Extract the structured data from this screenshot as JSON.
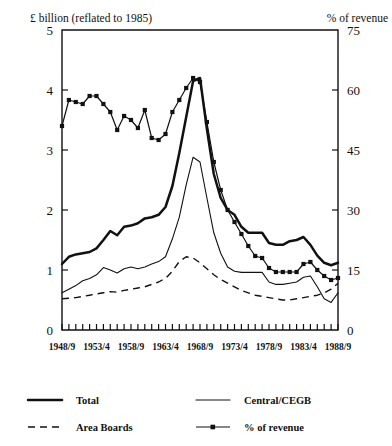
{
  "header": {
    "left_label": "£ billion (reflated to 1985)",
    "right_label": "% of revenue"
  },
  "legend": {
    "items": [
      {
        "label": "Total",
        "style": "thick-solid",
        "name": "legend-total"
      },
      {
        "label": "Central/CEGB",
        "style": "thin-solid",
        "name": "legend-central-cegb"
      },
      {
        "label": "Area Boards",
        "style": "dashed",
        "name": "legend-area-boards"
      },
      {
        "label": "% of revenue",
        "style": "marker-line",
        "name": "legend-pct-of-revenue"
      }
    ]
  },
  "chart_data": {
    "type": "line",
    "title": "",
    "xlabel": "",
    "ylabel": "£ billion (reflated to 1985)",
    "y2label": "% of revenue",
    "grid": false,
    "legend_position": "bottom",
    "ylim": [
      0,
      5
    ],
    "y2lim": [
      0,
      75
    ],
    "yticks": [
      0,
      1,
      2,
      3,
      4,
      5
    ],
    "y2ticks": [
      0,
      15,
      30,
      45,
      60,
      75
    ],
    "xticklabels": [
      "1948/9",
      "1953/4",
      "1958/9",
      "1963/4",
      "1968/9",
      "1973/4",
      "1978/9",
      "1983/4",
      "1988/9"
    ],
    "x": [
      "1948/9",
      "1949/50",
      "1950/1",
      "1951/2",
      "1952/3",
      "1953/4",
      "1954/5",
      "1955/6",
      "1956/7",
      "1957/8",
      "1958/9",
      "1959/60",
      "1960/1",
      "1961/2",
      "1962/3",
      "1963/4",
      "1964/5",
      "1965/6",
      "1966/7",
      "1967/8",
      "1968/9",
      "1969/70",
      "1970/1",
      "1971/2",
      "1972/3",
      "1973/4",
      "1974/5",
      "1975/6",
      "1976/7",
      "1977/8",
      "1978/9",
      "1979/80",
      "1980/1",
      "1981/2",
      "1982/3",
      "1983/4",
      "1984/5",
      "1985/6",
      "1986/7",
      "1987/8",
      "1988/9"
    ],
    "series": [
      {
        "name": "Total",
        "axis": "left",
        "style": "thick-solid",
        "values": [
          1.1,
          1.22,
          1.26,
          1.28,
          1.3,
          1.36,
          1.5,
          1.65,
          1.58,
          1.72,
          1.74,
          1.78,
          1.86,
          1.88,
          1.92,
          2.05,
          2.4,
          2.95,
          3.55,
          4.15,
          4.2,
          3.35,
          2.6,
          2.2,
          2.0,
          1.92,
          1.72,
          1.62,
          1.62,
          1.62,
          1.45,
          1.42,
          1.42,
          1.48,
          1.5,
          1.55,
          1.42,
          1.24,
          1.12,
          1.08,
          1.12
        ]
      },
      {
        "name": "Central/CEGB",
        "axis": "left",
        "style": "thin-solid",
        "values": [
          0.62,
          0.68,
          0.74,
          0.82,
          0.86,
          0.92,
          1.04,
          1.0,
          0.95,
          1.02,
          1.05,
          1.02,
          1.05,
          1.1,
          1.14,
          1.22,
          1.52,
          1.88,
          2.42,
          2.88,
          2.8,
          2.2,
          1.62,
          1.28,
          1.05,
          0.98,
          0.96,
          0.96,
          0.96,
          0.96,
          0.8,
          0.76,
          0.76,
          0.78,
          0.8,
          0.88,
          0.9,
          0.72,
          0.52,
          0.46,
          0.62
        ]
      },
      {
        "name": "Area Boards",
        "axis": "left",
        "style": "dashed",
        "values": [
          0.52,
          0.53,
          0.54,
          0.56,
          0.58,
          0.6,
          0.62,
          0.64,
          0.63,
          0.66,
          0.68,
          0.7,
          0.72,
          0.76,
          0.8,
          0.86,
          0.98,
          1.14,
          1.22,
          1.2,
          1.12,
          1.02,
          0.92,
          0.84,
          0.78,
          0.72,
          0.66,
          0.62,
          0.58,
          0.56,
          0.54,
          0.52,
          0.5,
          0.5,
          0.52,
          0.54,
          0.56,
          0.58,
          0.62,
          0.68,
          0.78
        ]
      },
      {
        "name": "% of revenue",
        "axis": "right",
        "style": "marker-line",
        "values": [
          51.0,
          57.5,
          57.0,
          56.5,
          58.5,
          58.5,
          56.5,
          54.5,
          50.0,
          53.5,
          52.5,
          50.5,
          55.0,
          48.0,
          47.5,
          49.0,
          54.5,
          57.5,
          60.5,
          63.0,
          62.0,
          52.0,
          42.0,
          35.0,
          30.0,
          27.0,
          24.0,
          21.0,
          18.5,
          18.0,
          15.5,
          14.5,
          14.5,
          14.5,
          14.5,
          16.5,
          17.0,
          15.0,
          13.5,
          12.5,
          13.0
        ]
      }
    ]
  }
}
